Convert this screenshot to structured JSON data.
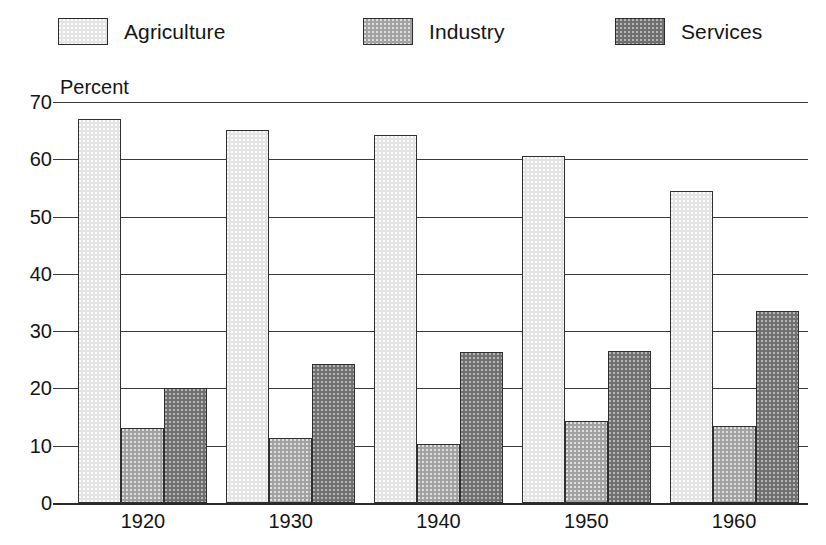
{
  "chart_data": {
    "type": "bar",
    "title": "",
    "subtitle": "",
    "xlabel": "",
    "ylabel": "Percent",
    "ylim": [
      0,
      70
    ],
    "yticks": [
      0,
      10,
      20,
      30,
      40,
      50,
      60,
      70
    ],
    "grid": true,
    "grid_axis": "y",
    "legend_position": "top",
    "categories": [
      "1920",
      "1930",
      "1940",
      "1950",
      "1960"
    ],
    "series": [
      {
        "name": "Agriculture",
        "color": "#e4e4e4",
        "values": [
          67.0,
          65.2,
          64.3,
          60.5,
          54.5
        ]
      },
      {
        "name": "Industry",
        "color": "#a2a2a2",
        "values": [
          13.1,
          11.3,
          10.3,
          14.4,
          13.5
        ]
      },
      {
        "name": "Services",
        "color": "#707070",
        "values": [
          20.1,
          24.3,
          26.4,
          26.5,
          33.5
        ]
      }
    ]
  },
  "legend": {
    "items": [
      {
        "label": "Agriculture",
        "swatch": "legend-swatch-agriculture"
      },
      {
        "label": "Industry",
        "swatch": "legend-swatch-industry"
      },
      {
        "label": "Services",
        "swatch": "legend-swatch-services"
      }
    ]
  },
  "axes": {
    "y_title": "Percent",
    "y_ticks": [
      "70",
      "60",
      "50",
      "40",
      "30",
      "20",
      "10",
      "0"
    ],
    "x_ticks": [
      "1920",
      "1930",
      "1940",
      "1950",
      "1960"
    ]
  }
}
